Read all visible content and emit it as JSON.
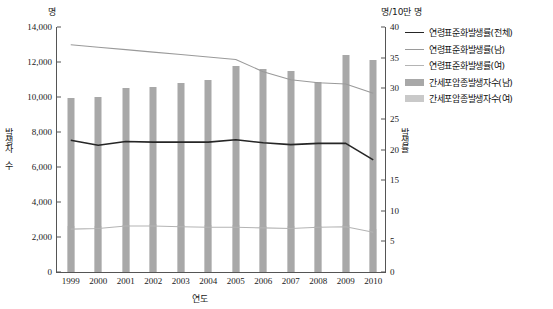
{
  "units": {
    "left": "명",
    "right": "명/10만 명"
  },
  "axis_titles": {
    "y_left": "발생자 수",
    "y_right": "발생률",
    "x": "연도"
  },
  "legend": {
    "items": [
      {
        "label": "연령표준화발생률(전체)",
        "type": "line",
        "color": "#262626",
        "width": 1.6
      },
      {
        "label": "연령표준화발생률(남)",
        "type": "line",
        "color": "#9a9a9a",
        "width": 1.2
      },
      {
        "label": "연령표준화발생률(여)",
        "type": "line",
        "color": "#b4b4b4",
        "width": 1.2
      },
      {
        "label": "간세포암종발생자수(남)",
        "type": "bar",
        "color": "#a8a8a8"
      },
      {
        "label": "간세포암종발생자수(여)",
        "type": "bar",
        "color": "#c9c9c9"
      }
    ]
  },
  "chart_data": {
    "type": "bar",
    "title": "",
    "subtitle": "",
    "xlabel": "연도",
    "ylabel": "발생자 수",
    "ylabel_secondary": "발생률",
    "unit_left": "명",
    "unit_right": "명/10만 명",
    "grid": false,
    "legend_position": "right",
    "categories": [
      "1999",
      "2000",
      "2001",
      "2002",
      "2003",
      "2004",
      "2005",
      "2006",
      "2007",
      "2008",
      "2009",
      "2010"
    ],
    "ylim": [
      0,
      14000
    ],
    "yticks": [
      0,
      2000,
      4000,
      6000,
      8000,
      10000,
      12000,
      14000
    ],
    "ytick_labels": [
      "0",
      "2,000",
      "4,000",
      "6,000",
      "8,000",
      "10,000",
      "12,000",
      "14,000"
    ],
    "ylim_secondary": [
      0,
      40
    ],
    "yticks_secondary": [
      0,
      5,
      10,
      15,
      20,
      25,
      30,
      35,
      40
    ],
    "ytick_labels_secondary": [
      "0",
      "5",
      "10",
      "15",
      "20",
      "25",
      "30",
      "35",
      "40"
    ],
    "series": [
      {
        "name": "간세포암종발생자수(남)",
        "type": "bar",
        "axis": "left",
        "color": "#a8a8a8",
        "values": [
          9950,
          9980,
          10500,
          10570,
          10780,
          11000,
          11800,
          11620,
          11480,
          10830,
          12420,
          12120
        ]
      },
      {
        "name": "간세포암종발생자수(여)",
        "type": "bar",
        "axis": "left",
        "color": "#c9c9c9",
        "values": [
          2650,
          2640,
          2700,
          2720,
          2700,
          2690,
          2680,
          2650,
          2640,
          2620,
          2680,
          2480
        ]
      },
      {
        "name": "연령표준화발생률(전체)",
        "type": "line",
        "axis": "right",
        "color": "#262626",
        "values": [
          21.5,
          20.7,
          21.3,
          21.2,
          21.2,
          21.2,
          21.6,
          21.1,
          20.8,
          21.0,
          21.0,
          18.3
        ]
      },
      {
        "name": "연령표준화발생률(남)",
        "type": "line",
        "axis": "right",
        "color": "#9a9a9a",
        "values": [
          37.1,
          36.7,
          36.3,
          35.9,
          35.5,
          35.1,
          34.7,
          32.7,
          31.4,
          30.9,
          30.7,
          29.2
        ]
      },
      {
        "name": "연령표준화발생률(여)",
        "type": "line",
        "axis": "right",
        "color": "#b4b4b4",
        "values": [
          7.0,
          7.1,
          7.5,
          7.5,
          7.4,
          7.3,
          7.3,
          7.2,
          7.1,
          7.3,
          7.4,
          6.5
        ]
      }
    ]
  }
}
